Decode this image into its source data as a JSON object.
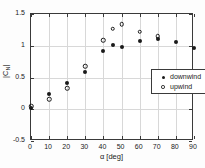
{
  "chart_data": {
    "type": "scatter",
    "title": "",
    "xlabel": "α [deg]",
    "ylabel_parts": {
      "pre": "|C",
      "sub": "N",
      "post": "|"
    },
    "xlim": [
      0,
      90
    ],
    "ylim": [
      -0.5,
      1.5
    ],
    "xticks": [
      0,
      10,
      20,
      30,
      40,
      50,
      60,
      70,
      80,
      90
    ],
    "xticklabels": [
      "0",
      "10",
      "20",
      "30",
      "40",
      "50",
      "60",
      "70",
      "80",
      "90"
    ],
    "yticks": [
      -0.5,
      0,
      0.5,
      1,
      1.5
    ],
    "yticklabels": [
      "-0.5",
      "0",
      "0.5",
      "1",
      "1.5"
    ],
    "grid": true,
    "legend_position": "upper right",
    "series": [
      {
        "name": "downwind",
        "marker": "filled-circle",
        "color": "#1a1a1a",
        "x": [
          0,
          10,
          20,
          30,
          40,
          45,
          50,
          60,
          70,
          80,
          90
        ],
        "y": [
          0.02,
          0.24,
          0.42,
          0.58,
          0.92,
          1.01,
          0.98,
          1.08,
          1.11,
          1.06,
          0.97
        ]
      },
      {
        "name": "upwind",
        "marker": "open-circle",
        "color": "#1a1a1a",
        "x": [
          0,
          10,
          20,
          30,
          40,
          45,
          50,
          60,
          70
        ],
        "y": [
          0.05,
          0.16,
          0.33,
          0.68,
          1.09,
          1.27,
          1.34,
          1.22,
          1.15
        ]
      }
    ]
  },
  "legend": {
    "items": [
      {
        "label": "downwind",
        "marker": "filled-circle"
      },
      {
        "label": "upwind",
        "marker": "open-circle"
      }
    ]
  }
}
